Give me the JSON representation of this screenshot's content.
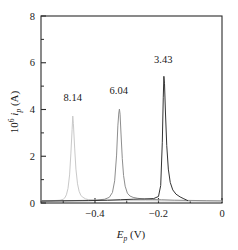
{
  "chart_data": {
    "type": "line",
    "title": "",
    "subtitle": "",
    "xlabel": "E_p (V)",
    "ylabel": "10^6 i_p (A)",
    "xlim": [
      -0.57,
      0.0
    ],
    "ylim": [
      0,
      8
    ],
    "xticks": [
      -0.4,
      -0.2,
      0
    ],
    "xtick_labels": [
      "−0.4",
      "−0.2",
      "0"
    ],
    "xminorticks": [
      -0.5,
      -0.3,
      -0.1
    ],
    "yticks": [
      0,
      2,
      4,
      6,
      8
    ],
    "ytick_labels": [
      "0",
      "2",
      "4",
      "6",
      "8"
    ],
    "yminorticks": [
      1,
      3,
      5,
      7
    ],
    "grid": false,
    "legend": "none",
    "annotations": [
      {
        "text": "8.14",
        "x": -0.47,
        "y": 4.35
      },
      {
        "text": "6.04",
        "x": -0.325,
        "y": 4.65
      },
      {
        "text": "3.43",
        "x": -0.185,
        "y": 6.0
      }
    ],
    "series": [
      {
        "name": "8.14",
        "color": "#c9c9c9",
        "peak_x": -0.47,
        "peak_y": 3.72,
        "baseline": 0.1,
        "width": 0.016,
        "x": [
          -0.57,
          -0.54,
          -0.52,
          -0.51,
          -0.5,
          -0.495,
          -0.49,
          -0.485,
          -0.48,
          -0.476,
          -0.472,
          -0.47,
          -0.468,
          -0.464,
          -0.46,
          -0.455,
          -0.45,
          -0.445,
          -0.44,
          -0.43,
          -0.42,
          -0.4,
          -0.36,
          -0.3,
          -0.24,
          -0.18,
          -0.12,
          -0.06,
          0.0
        ],
        "y": [
          0.1,
          0.1,
          0.11,
          0.12,
          0.16,
          0.22,
          0.35,
          0.62,
          1.2,
          2.1,
          3.15,
          3.72,
          3.4,
          2.35,
          1.45,
          0.82,
          0.5,
          0.34,
          0.26,
          0.18,
          0.14,
          0.12,
          0.11,
          0.1,
          0.1,
          0.09,
          0.09,
          0.08,
          0.08
        ]
      },
      {
        "name": "6.04",
        "color": "#8e8e8e",
        "peak_x": -0.323,
        "peak_y": 4.02,
        "baseline": 0.12,
        "width": 0.011,
        "x": [
          -0.57,
          -0.5,
          -0.44,
          -0.4,
          -0.37,
          -0.355,
          -0.345,
          -0.338,
          -0.332,
          -0.328,
          -0.325,
          -0.323,
          -0.321,
          -0.318,
          -0.314,
          -0.31,
          -0.305,
          -0.298,
          -0.29,
          -0.28,
          -0.265,
          -0.245,
          -0.22,
          -0.19,
          -0.15,
          -0.1,
          -0.05,
          0.0
        ],
        "y": [
          0.09,
          0.1,
          0.11,
          0.12,
          0.16,
          0.24,
          0.45,
          0.95,
          2.05,
          3.3,
          3.85,
          4.02,
          3.8,
          2.95,
          1.9,
          1.18,
          0.72,
          0.42,
          0.3,
          0.24,
          0.2,
          0.17,
          0.15,
          0.14,
          0.12,
          0.11,
          0.1,
          0.09
        ]
      },
      {
        "name": "3.43",
        "color": "#333333",
        "peak_x": -0.183,
        "peak_y": 5.42,
        "baseline": 0.18,
        "width": 0.01,
        "x": [
          -0.57,
          -0.5,
          -0.42,
          -0.36,
          -0.32,
          -0.28,
          -0.245,
          -0.215,
          -0.2,
          -0.193,
          -0.188,
          -0.185,
          -0.183,
          -0.181,
          -0.178,
          -0.174,
          -0.169,
          -0.163,
          -0.155,
          -0.145,
          -0.132,
          -0.12,
          -0.112,
          -0.108
        ],
        "y": [
          0.08,
          0.09,
          0.1,
          0.12,
          0.14,
          0.16,
          0.17,
          0.19,
          0.28,
          0.75,
          2.6,
          4.5,
          5.42,
          5.1,
          3.85,
          2.45,
          1.45,
          0.88,
          0.56,
          0.38,
          0.26,
          0.18,
          0.13,
          0.1
        ]
      }
    ]
  }
}
